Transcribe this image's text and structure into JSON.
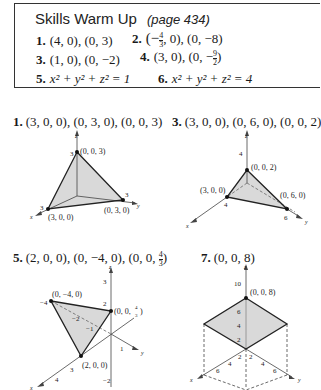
{
  "warmup": {
    "title": "Skills Warm Up",
    "page_ref": "(page 434)",
    "items": [
      {
        "num": "1.",
        "text": "(4, 0), (0, 3)"
      },
      {
        "num": "2.",
        "text_pre": "(−",
        "frac_num": "4",
        "frac_den": "3",
        "text_post": ", 0), (0, −8)"
      },
      {
        "num": "3.",
        "text": "(1, 0), (0, −2)"
      },
      {
        "num": "4.",
        "text_pre": "(3, 0), (0, −",
        "frac_num": "9",
        "frac_den": "2",
        "text_post": ")"
      },
      {
        "num": "5.",
        "text": "x² + y² + z² = 1"
      },
      {
        "num": "6.",
        "text": "x² + y² + z² = 4"
      }
    ]
  },
  "exercises": [
    {
      "num": "1.",
      "text": "(3, 0, 0), (0, 3, 0), (0, 0, 3)",
      "graph": {
        "axis_labels": {
          "x": "x",
          "y": "y",
          "z": "z"
        },
        "ticks": {
          "x": "3",
          "y": "3",
          "z": "3"
        },
        "points": [
          "(3, 0, 0)",
          "(0, 3, 0)",
          "(0, 0, 3)"
        ]
      }
    },
    {
      "num": "3.",
      "text": "(3, 0, 0), (0, 6, 0), (0, 0, 2)",
      "graph": {
        "axis_labels": {
          "x": "x",
          "y": "y",
          "z": "z"
        },
        "ticks": {
          "x": "4",
          "y": "6",
          "z": "4"
        },
        "points": [
          "(3, 0, 0)",
          "(0, 6, 0)",
          "(0, 0, 2)"
        ]
      }
    },
    {
      "num": "5.",
      "text_pre": "(2, 0, 0), (0, −4, 0), (0, 0, ",
      "frac_num": "4",
      "frac_den": "3",
      "text_post": ")",
      "graph": {
        "axis_labels": {
          "x": "x",
          "y": "y",
          "z": "z"
        },
        "ticks": {
          "x": [
            "3",
            "4"
          ],
          "y": [
            "−4",
            "−2",
            "−1",
            "1"
          ],
          "z": [
            "3",
            "2",
            "1",
            "−2"
          ]
        },
        "points": [
          "(0, −4, 0)",
          "(0, 0, 4/3)",
          "(2, 0, 0)"
        ],
        "point_z_pre": "(0, 0, ",
        "point_z_num": "4",
        "point_z_den": "3",
        "point_z_post": ")"
      }
    },
    {
      "num": "7.",
      "text": "(0, 0, 8)",
      "graph": {
        "axis_labels": {
          "x": "x",
          "y": "y",
          "z": "z"
        },
        "ticks": {
          "x": [
            "2",
            "4",
            "6"
          ],
          "y": [
            "2",
            "4",
            "6"
          ],
          "z": [
            "10",
            "6",
            "4",
            "2"
          ]
        },
        "points": [
          "(0, 0, 8)"
        ]
      }
    }
  ]
}
